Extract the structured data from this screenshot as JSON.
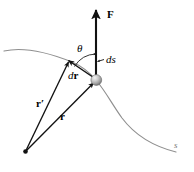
{
  "figure": {
    "colors": {
      "stroke": "#111111",
      "curve": "#8a8a8a",
      "sphere_light": "#e8e8e8",
      "sphere_mid": "#b4b4b4",
      "sphere_dark": "#6f6f6f",
      "background": "#ffffff"
    },
    "labels": [
      {
        "id": "force",
        "name": "force-vector-label",
        "text": "F",
        "style": "bold",
        "x": 108,
        "y": 10
      },
      {
        "id": "theta",
        "name": "theta-angle-label",
        "text": "θ",
        "style": "italic",
        "x": 78,
        "y": 44
      },
      {
        "id": "ds",
        "name": "arc-length-label",
        "text": "ds",
        "style": "italic",
        "x": 106,
        "y": 55
      },
      {
        "id": "dr",
        "name": "displacement-vector-label",
        "text": "dr",
        "style": "mixed",
        "x": 69,
        "y": 71
      },
      {
        "id": "rprime",
        "name": "r-prime-vector-label",
        "text": "r′",
        "style": "bold",
        "x": 37,
        "y": 99
      },
      {
        "id": "r",
        "name": "position-vector-label",
        "text": "r",
        "style": "bold",
        "x": 61,
        "y": 112
      },
      {
        "id": "path",
        "name": "path-label",
        "text": "s",
        "style": "italic",
        "x": 174,
        "y": 142
      }
    ],
    "geometry": {
      "origin_point": {
        "x": 25,
        "y": 152
      },
      "particle": {
        "x": 96,
        "y": 80,
        "r": 5.4
      },
      "dr_tip": {
        "x": 68,
        "y": 60
      },
      "force_arrow": {
        "x1": 96,
        "y1": 80,
        "x2": 96,
        "y2": 8
      },
      "ds_leader": {
        "x1": 104,
        "y1": 60,
        "x2": 96,
        "y2": 62
      },
      "theta_arc_r": 26
    },
    "elements": [
      {
        "name": "trajectory-curve",
        "kind": "curve"
      },
      {
        "name": "force-arrow",
        "kind": "arrow"
      },
      {
        "name": "dr-arrow",
        "kind": "arrow"
      },
      {
        "name": "r-prime-arrow",
        "kind": "arrow"
      },
      {
        "name": "r-arrow",
        "kind": "arrow"
      },
      {
        "name": "theta-arc",
        "kind": "arc"
      },
      {
        "name": "ds-leader-line",
        "kind": "leader"
      },
      {
        "name": "particle-sphere",
        "kind": "sphere"
      },
      {
        "name": "origin-dot",
        "kind": "dot"
      }
    ]
  }
}
